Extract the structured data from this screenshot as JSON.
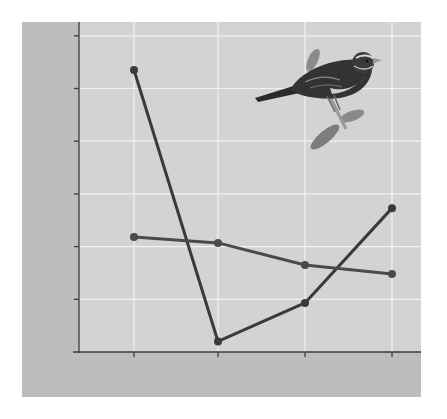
{
  "chart_data": {
    "type": "line",
    "title": "",
    "xlabel": "",
    "ylabel": "",
    "categories": [
      "",
      "",
      "",
      ""
    ],
    "x_tick_labels_visible": false,
    "y_tick_labels_visible": false,
    "ylim": [
      0,
      6.3
    ],
    "y_gridlines": [
      1,
      2,
      3,
      4,
      5,
      6
    ],
    "grid": true,
    "legend": "none",
    "series": [
      {
        "name": "Series A",
        "values": [
          5.35,
          0.2,
          0.93,
          2.73
        ],
        "color": "#3a3a3a"
      },
      {
        "name": "Series B",
        "values": [
          2.18,
          2.07,
          1.65,
          1.48
        ],
        "color": "#4a4a4a"
      }
    ],
    "annotations": [
      {
        "type": "image",
        "description": "illustration of a sparrow perched on a leafy twig",
        "position": "upper-right"
      }
    ]
  },
  "colors": {
    "page_background": "#ffffff",
    "outer_panel": "#bdbdbd",
    "plot_background": "#d3d3d3",
    "gridline": "#f2f2f2",
    "axis": "#3c3c3c"
  }
}
